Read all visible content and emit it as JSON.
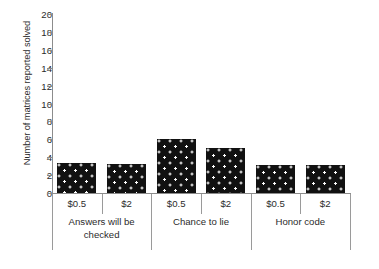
{
  "chart_data": {
    "type": "bar",
    "title": "",
    "subtitle": "",
    "xlabel": "",
    "ylabel": "Number of matrices reported solved",
    "ylim": [
      0,
      20
    ],
    "ytick_step": 2,
    "yticks": [
      "20",
      "18",
      "16",
      "14",
      "12",
      "10",
      "8",
      "6",
      "4",
      "2",
      "0"
    ],
    "grid": false,
    "legend": "none",
    "bar_color": "#111111",
    "bar_pattern": "white-polka-dots",
    "axis_color": "#8c8c8c",
    "categories": [
      "$0.5",
      "$2",
      "$0.5",
      "$2",
      "$0.5",
      "$2"
    ],
    "values": [
      3.4,
      3.2,
      6.0,
      5.0,
      3.1,
      3.1
    ],
    "groups": [
      {
        "label": "Answers will be checked",
        "label_lines": [
          "Answers will be",
          "checked"
        ],
        "bars": [
          {
            "category": "$0.5",
            "value": 3.4
          },
          {
            "category": "$2",
            "value": 3.2
          }
        ]
      },
      {
        "label": "Chance to lie",
        "label_lines": [
          "Chance to lie"
        ],
        "bars": [
          {
            "category": "$0.5",
            "value": 6.0
          },
          {
            "category": "$2",
            "value": 5.0
          }
        ]
      },
      {
        "label": "Honor code",
        "label_lines": [
          "Honor code"
        ],
        "bars": [
          {
            "category": "$0.5",
            "value": 3.1
          },
          {
            "category": "$2",
            "value": 3.1
          }
        ]
      }
    ]
  }
}
